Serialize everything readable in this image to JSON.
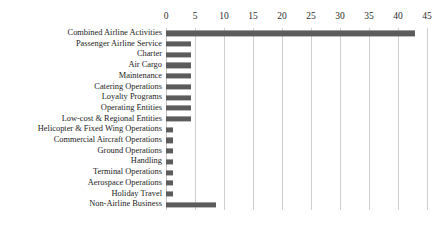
{
  "chart_data": {
    "type": "bar",
    "orientation": "horizontal",
    "title": "",
    "subtitle": "",
    "xlabel": "",
    "ylabel": "",
    "xlim": [
      0,
      45
    ],
    "ylim": null,
    "xticks": [
      0,
      5,
      10,
      15,
      20,
      25,
      30,
      35,
      40,
      45
    ],
    "xtick_labels": [
      "0",
      "5",
      "10",
      "15",
      "20",
      "25",
      "30",
      "35",
      "40",
      "45"
    ],
    "xaxis_position": "top",
    "grid": true,
    "grid_axis": "x",
    "legend": false,
    "legend_position": "none",
    "bar_color": "#5c5c5c",
    "grid_color": "#cfcfcf",
    "background_color": "#ffffff",
    "categories": [
      "Combined Airline Activities",
      "Passenger Airline Service",
      "Charter",
      "Air Cargo",
      "Maintenance",
      "Catering Operations",
      "Loyalty Programs",
      "Operating Entities",
      "Low-cost & Regional Entities",
      "Helicopter & Fixed Wing Operations",
      "Commercial Aircraft Operations",
      "Ground Operations",
      "Handling",
      "Terminal Operations",
      "Aerospace Operations",
      "Holiday Travel",
      "Non-Airline Business"
    ],
    "values": [
      43,
      4.3,
      4.3,
      4.3,
      4.3,
      4.3,
      4.3,
      4.3,
      4.3,
      1.2,
      1.2,
      1.2,
      1.2,
      1.2,
      1.2,
      1.2,
      8.6
    ]
  }
}
